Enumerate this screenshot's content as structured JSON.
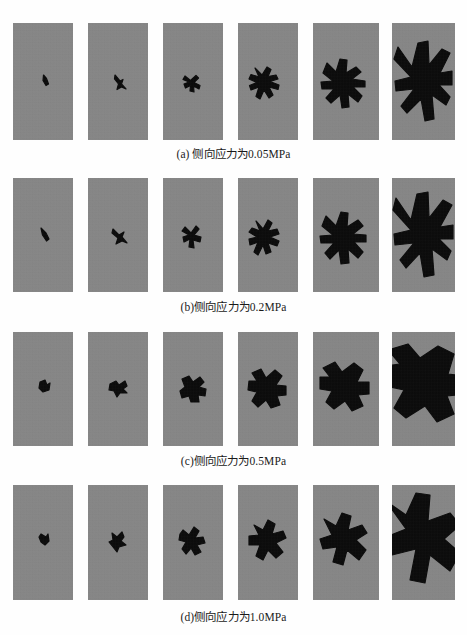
{
  "figure": {
    "panel_fill": "#878787",
    "crack_fill": "#080808",
    "background": "#fefefe",
    "columns": 6,
    "rows": [
      {
        "id": "a",
        "caption": "(a) 侧向应力为0.05MPa",
        "lateral_stress": "0.05MPa",
        "top": 23,
        "caption_top": 145,
        "panel_width": 60,
        "panel_height": 117,
        "panel_lefts": [
          13,
          88,
          163,
          238,
          313,
          392
        ],
        "panel_widths": [
          60,
          60,
          60,
          60,
          66,
          63
        ],
        "cracks": [
          "M30.5,52 L33.5,55.5 L35.5,61 L33,62.5 L30,57.5 Z",
          "M27,52 L32,58 L35,56.5 L33.5,61 L38,66 L33.5,64 L29,66.5 L30.5,61 L26.5,56 Z",
          "M22,53 L27.5,57.5 L33,52.5 L35.5,55 L31,59.5 L37,62.5 L36,66 L30.5,63 L31,69 L27,68 L27.5,62.5 L22.5,65 L21,61 L26,59 L20,56.5 Z",
          "M17,45 L24,52 L29,44 L33,46.5 L30,53.5 L38,52 L40,56 L32,58.5 L41,62 L40,66.5 L31,64 L35,72 L31,75 L26,67 L22,76 L18,73.5 L21,64 L13,67 L11.5,62.5 L19,59.5 L11,56 L13,51.5 L21,54 Z",
          "M14,40 L23,49 L27,36 L34,37 L33,50 L43,44 L48,49 L39,56 L52,58 L52,64 L40,64 L49,73 L45,79 L35,71 L36,84 L29,85 L27,72 L18,80 L13,75 L21,66 L9,66 L8,59 L20,58 L10,50 Z",
          "M6,24 L20,44 L26,20 L36,18 L37,42 L50,26 L58,30 L48,50 L60,48 L60,62 L47,62 L58,74 L54,82 L40,72 L42,96 L33,98 L29,76 L15,90 L9,83 L22,66 L4,68 L3,58 L19,54 L2,36 Z"
        ]
      },
      {
        "id": "b",
        "caption": "(b)侧向应力为0.2MPa",
        "lateral_stress": "0.2MPa",
        "top": 178,
        "caption_top": 298,
        "panel_width": 60,
        "panel_height": 114,
        "panel_lefts": [
          13,
          88,
          163,
          238,
          313,
          392
        ],
        "panel_widths": [
          60,
          60,
          60,
          60,
          66,
          63
        ],
        "cracks": [
          "M28,50 L33,55 L36,61 L33.5,63 L29.5,57 Z",
          "M25,51 L31,57 L36,54 L34,59 L39,65 L34,63 L28,66 L30,60 L24,55 Z",
          "M22,49 L28,55 L33,48 L36,51 L31,57 L38,59 L37,64 L30,62 L31,70 L26,69 L27,61 L21,64 L20,59 L26,57 L19,53 Z",
          "M18,43 L25,51 L30,42 L34,45 L30,53 L39,51 L41,56 L32,59 L41,63 L39,68 L30,65 L33,74 L28,76 L25,67 L20,77 L16,74 L20,64 L12,67 L11,61 L19,59 L11,54 L14,50 L22,53 Z",
          "M13,38 L23,48 L28,34 L35,35 L34,49 L45,42 L50,48 L40,56 L53,57 L53,64 L41,64 L50,74 L45,80 L35,71 L36,85 L28,86 L26,72 L17,81 L12,75 L21,65 L8,65 L7,58 L20,57 L9,48 Z",
          "M4,20 L19,42 L25,16 L36,14 L37,40 L51,22 L60,27 L48,49 L61,47 L61,61 L47,61 L59,73 L55,82 L40,71 L42,97 L32,99 L28,75 L14,90 L8,82 L22,65 L3,67 L2,56 L19,52 L1,32 Z"
        ]
      },
      {
        "id": "c",
        "caption": "(c)侧向应力为0.5MPa",
        "lateral_stress": "0.5MPa",
        "top": 332,
        "caption_top": 452,
        "panel_width": 60,
        "panel_height": 114,
        "panel_lefts": [
          13,
          88,
          163,
          238,
          313,
          392
        ],
        "panel_widths": [
          60,
          60,
          60,
          60,
          66,
          63
        ],
        "cracks": [
          "M27,50 L32,48 L34,53 L37,51 L36,58 L30,60 L26,56 Z",
          "M22,52 L28,49 L31,53 L37,49 L39,54 L35,57 L39,61 L32,61 L29,65 L26,59 L21,58 Z",
          "M19,47 L26,44 L30,50 L37,45 L41,50 L36,55 L43,57 L42,64 L35,63 L36,70 L28,70 L26,64 L19,66 L17,59 L22,55 Z",
          "M14,41 L23,37 L28,46 L37,38 L44,44 L38,53 L48,54 L48,63 L39,64 L42,73 L33,76 L28,68 L20,75 L14,69 L19,60 L10,58 L11,49 L19,49 Z",
          "M10,36 L22,30 L29,40 L41,31 L50,38 L44,50 L56,50 L56,62 L45,63 L50,74 L39,79 L32,69 L21,77 L13,70 L19,59 L7,57 L7,45 L17,45 Z",
          "M-4,18 L16,12 L28,26 L46,14 L62,22 L56,42 L72,44 L72,62 L55,64 L62,82 L45,90 L33,74 L14,86 L2,76 L12,58 L-6,54 L-6,34 L8,32 Z"
        ]
      },
      {
        "id": "d",
        "caption": "(d)侧向应力为1.0MPa",
        "lateral_stress": "1.0MPa",
        "top": 485,
        "caption_top": 608,
        "panel_width": 60,
        "panel_height": 115,
        "panel_lefts": [
          13,
          88,
          163,
          238,
          313,
          392
        ],
        "panel_widths": [
          60,
          60,
          60,
          60,
          66,
          63
        ],
        "cracks": [
          "M28,49 L33,52 L35,49 L36,56 L32,60 L28,57 L26,52 Z",
          "M24,48 L29,52 L34,47 L36,52 L33,56 L38,60 L31,62 L29,67 L25,62 L21,57 L25,55 Z",
          "M20,45 L26,50 L31,42 L36,46 L32,53 L40,52 L42,58 L34,60 L38,67 L32,70 L28,63 L23,69 L19,64 L23,57 L16,55 L17,49 Z",
          "M16,40 L25,45 L30,35 L37,39 L34,49 L45,46 L48,53 L38,58 L45,67 L38,73 L30,65 L25,75 L18,71 L22,60 L11,60 L11,51 L21,50 Z",
          "M11,34 L23,41 L29,28 L38,31 L35,45 L49,40 L54,48 L43,55 L53,65 L46,75 L34,65 L30,80 L20,77 L24,62 L10,64 L7,54 L19,50 Z",
          "M-6,16 L14,30 L24,8 L38,10 L36,36 L58,28 L68,40 L52,54 L68,68 L58,86 L38,70 L33,98 L18,95 L24,64 L0,70 L-6,52 L14,44 Z"
        ]
      }
    ]
  }
}
